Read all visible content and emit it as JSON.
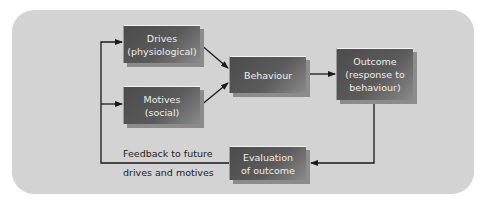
{
  "diagram": {
    "nodes": {
      "drives": {
        "line1": "Drives",
        "line2": "(physiological)"
      },
      "motives": {
        "line1": "Motives",
        "line2": "(social)"
      },
      "behaviour": {
        "line1": "Behaviour"
      },
      "outcome": {
        "line1": "Outcome",
        "line2": "(response to",
        "line3": "behaviour)"
      },
      "evaluation": {
        "line1": "Evaluation",
        "line2": "of outcome"
      }
    },
    "feedback_label": {
      "line1": "Feedback to future",
      "line2": "drives and motives"
    },
    "edges": [
      {
        "from": "drives",
        "to": "behaviour"
      },
      {
        "from": "motives",
        "to": "behaviour"
      },
      {
        "from": "behaviour",
        "to": "outcome"
      },
      {
        "from": "outcome",
        "to": "evaluation"
      },
      {
        "from": "evaluation",
        "to": "drives"
      },
      {
        "from": "evaluation",
        "to": "motives"
      }
    ],
    "colors": {
      "panel": "#d3d3d3",
      "box": "#555555",
      "box_text": "#eeeeee",
      "line": "#1a1a1a"
    }
  }
}
